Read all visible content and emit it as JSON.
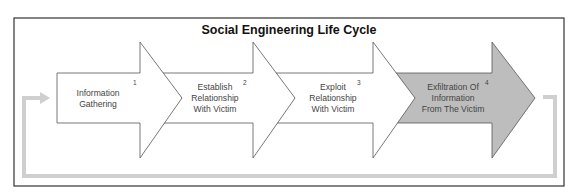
{
  "diagram": {
    "title": "Social Engineering Life Cycle",
    "steps": [
      {
        "number": "1",
        "lines": [
          "Information",
          "Gathering"
        ],
        "fill": "#ffffff"
      },
      {
        "number": "2",
        "lines": [
          "Establish",
          "Relationship",
          "With Victim"
        ],
        "fill": "#ffffff"
      },
      {
        "number": "3",
        "lines": [
          "Exploit",
          "Relationship",
          "With Victim"
        ],
        "fill": "#ffffff"
      },
      {
        "number": "4",
        "lines": [
          "Exfiltration Of",
          "Information",
          "From The Victim"
        ],
        "fill": "#bdbdbd"
      }
    ],
    "colors": {
      "frame": "#333333",
      "arrow_outline": "#666666",
      "loop_line": "#cfcfcf",
      "highlight_fill": "#bdbdbd"
    }
  }
}
